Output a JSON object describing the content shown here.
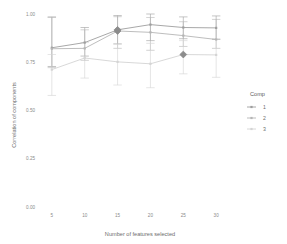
{
  "chart_data": {
    "type": "line",
    "title": "",
    "xlabel": "Number of features selected",
    "ylabel": "Correlation of components",
    "x": [
      5,
      10,
      15,
      20,
      25,
      30
    ],
    "xtick_labels": [
      "5",
      "10",
      "15",
      "20",
      "25",
      "30"
    ],
    "ytick_labels": [
      "0.00",
      "0.25",
      "0.50",
      "0.75",
      "1.00"
    ],
    "ytick_values": [
      0.0,
      0.25,
      0.5,
      0.75,
      1.0
    ],
    "ylim": [
      0.0,
      1.0
    ],
    "xlim": [
      3.2,
      31.8
    ],
    "grid": false,
    "legend": {
      "title": "Comp",
      "position": "right",
      "entries": [
        {
          "label": "1",
          "color": "#9e9e9e"
        },
        {
          "label": "2",
          "color": "#b5b5b5"
        },
        {
          "label": "3",
          "color": "#d4d4d4"
        }
      ]
    },
    "series": [
      {
        "name": "1",
        "color": "#9e9e9e",
        "values": [
          0.825,
          0.852,
          0.918,
          0.945,
          0.93,
          0.928
        ],
        "err_low": [
          0.728,
          0.782,
          0.845,
          0.862,
          0.872,
          0.868
        ],
        "err_high": [
          0.985,
          0.93,
          0.992,
          1.0,
          0.985,
          0.99
        ],
        "highlight_index": 2
      },
      {
        "name": "2",
        "color": "#b5b5b5",
        "values": [
          0.82,
          0.822,
          0.912,
          0.905,
          0.888,
          0.868
        ],
        "err_low": [
          0.722,
          0.76,
          0.822,
          0.812,
          0.832,
          0.822
        ],
        "err_high": [
          0.982,
          0.918,
          0.986,
          0.982,
          0.96,
          0.972
        ],
        "highlight_index": 2
      },
      {
        "name": "3",
        "color": "#d4d4d4",
        "values": [
          0.712,
          0.772,
          0.752,
          0.742,
          0.79,
          0.788
        ],
        "err_low": [
          0.578,
          0.668,
          0.632,
          0.618,
          0.69,
          0.672
        ],
        "err_high": [
          0.79,
          0.852,
          0.845,
          0.848,
          0.862,
          0.872
        ],
        "highlight_index": 4
      }
    ],
    "highlight_color": "#8c8c8c",
    "background": "#ffffff",
    "axis_color": "#bdbdbd"
  }
}
